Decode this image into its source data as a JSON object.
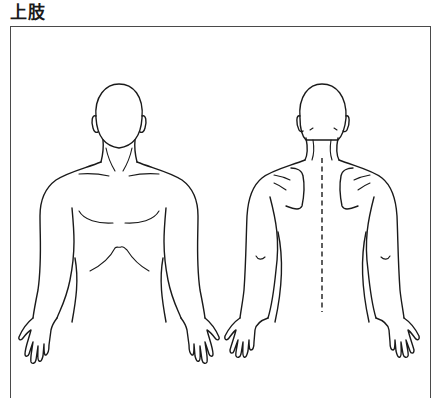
{
  "diagram": {
    "title": "上肢",
    "frame_color": "#4a4a4a",
    "line_color": "#1a1a1a",
    "views": [
      {
        "id": "front",
        "label": "front-view-figure"
      },
      {
        "id": "back",
        "label": "back-view-figure"
      }
    ],
    "regions": {
      "front": [
        "head",
        "ears",
        "neck",
        "clavicles",
        "chest",
        "ribcage",
        "arms",
        "hands"
      ],
      "back": [
        "head",
        "ears",
        "neck",
        "scapulae",
        "spine-dashed-line",
        "arms",
        "elbows",
        "hands"
      ]
    }
  }
}
